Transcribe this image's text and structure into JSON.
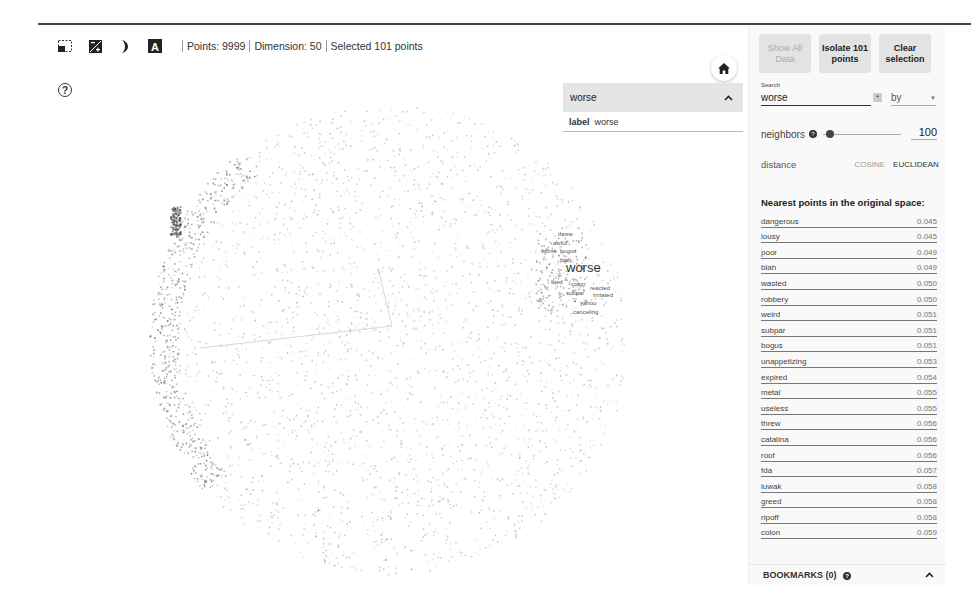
{
  "toolbar": {
    "icons": [
      "box-select-icon",
      "night-mode-icon",
      "label-mode-icon",
      "text-label-icon"
    ],
    "points_label": "Points: 9999",
    "dimension_label": "Dimension: 50",
    "selected_label": "Selected 101 points"
  },
  "help_icon": "?",
  "plot": {
    "focus_label": "worse",
    "neighbor_labels": [
      {
        "text": "threw",
        "x": 558,
        "y": 236
      },
      {
        "text": "awful",
        "x": 553,
        "y": 245
      },
      {
        "text": "worst",
        "x": 541,
        "y": 253
      },
      {
        "text": "bogus",
        "x": 560,
        "y": 253
      },
      {
        "text": "blah",
        "x": 560,
        "y": 262
      },
      {
        "text": "fried",
        "x": 551,
        "y": 284
      },
      {
        "text": "colon",
        "x": 571,
        "y": 286
      },
      {
        "text": "reacted",
        "x": 590,
        "y": 290
      },
      {
        "text": "subpar",
        "x": 566,
        "y": 295
      },
      {
        "text": "irritated",
        "x": 593,
        "y": 297
      },
      {
        "text": "yahoo",
        "x": 580,
        "y": 305
      },
      {
        "text": "canceling",
        "x": 573,
        "y": 314
      }
    ],
    "focus_position": {
      "x": 566,
      "y": 272
    },
    "point_color": "#888888",
    "highlight_color": "#333333"
  },
  "inspector": {
    "title": "worse",
    "field_key": "label",
    "field_value": "worse"
  },
  "panel": {
    "buttons": {
      "show_all": "Show All Data",
      "isolate": "Isolate 101 points",
      "clear": "Clear selection"
    },
    "search": {
      "label": "Search",
      "value": "worse",
      "regex_glyph": "*",
      "by_label": "by"
    },
    "neighbors": {
      "label": "neighbors",
      "value": "100"
    },
    "distance": {
      "label": "distance",
      "options": [
        "COSINE",
        "EUCLIDEAN"
      ],
      "selected": "EUCLIDEAN"
    },
    "nearest_title": "Nearest points in the original space:",
    "nearest": [
      {
        "word": "dangerous",
        "value": "0.045"
      },
      {
        "word": "lousy",
        "value": "0.045"
      },
      {
        "word": "poor",
        "value": "0.049"
      },
      {
        "word": "blah",
        "value": "0.049"
      },
      {
        "word": "wasted",
        "value": "0.050"
      },
      {
        "word": "robbery",
        "value": "0.050"
      },
      {
        "word": "weird",
        "value": "0.051"
      },
      {
        "word": "subpar",
        "value": "0.051"
      },
      {
        "word": "bogus",
        "value": "0.051"
      },
      {
        "word": "unappetizing",
        "value": "0.053"
      },
      {
        "word": "expired",
        "value": "0.054"
      },
      {
        "word": "metal",
        "value": "0.055"
      },
      {
        "word": "useless",
        "value": "0.055"
      },
      {
        "word": "threw",
        "value": "0.056"
      },
      {
        "word": "catalina",
        "value": "0.056"
      },
      {
        "word": "roof",
        "value": "0.056"
      },
      {
        "word": "fda",
        "value": "0.057"
      },
      {
        "word": "luwak",
        "value": "0.058"
      },
      {
        "word": "greed",
        "value": "0.058"
      },
      {
        "word": "ripoff",
        "value": "0.058"
      },
      {
        "word": "colon",
        "value": "0.059"
      }
    ],
    "bookmarks_label": "BOOKMARKS (0)"
  }
}
